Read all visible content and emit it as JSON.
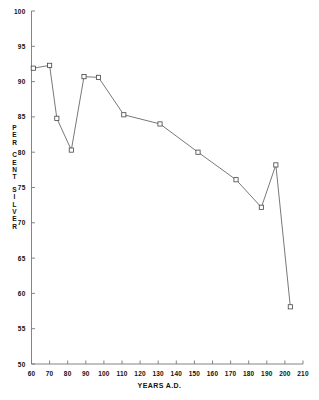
{
  "chart_data": {
    "type": "line",
    "title": "",
    "xlabel": "YEARS A.D.",
    "ylabel": "PER CENT SILVER",
    "ylabel_letters": [
      "P",
      "E",
      "R",
      "",
      "C",
      "E",
      "N",
      "T",
      "",
      "S",
      "I",
      "L",
      "V",
      "E",
      "R"
    ],
    "xlim": [
      60,
      210
    ],
    "ylim": [
      50,
      100
    ],
    "xticks": [
      60,
      70,
      80,
      90,
      100,
      110,
      120,
      130,
      140,
      150,
      160,
      170,
      180,
      190,
      200,
      210
    ],
    "yticks": [
      50,
      55,
      60,
      65,
      70,
      75,
      80,
      85,
      90,
      95,
      100
    ],
    "grid": false,
    "legend": false,
    "marker": "open-square",
    "line_color": "#555555",
    "marker_color": "#444444",
    "axis_color": "#777777",
    "x": [
      61,
      70,
      74,
      82,
      89,
      97,
      111,
      131,
      152,
      173,
      187,
      195,
      203
    ],
    "y": [
      91.9,
      92.3,
      84.8,
      80.3,
      90.7,
      90.6,
      85.3,
      84.0,
      80.0,
      76.1,
      72.2,
      78.2,
      58.1
    ],
    "points": [
      {
        "x": 61,
        "y": 91.9
      },
      {
        "x": 70,
        "y": 92.3
      },
      {
        "x": 74,
        "y": 84.8
      },
      {
        "x": 82,
        "y": 80.3
      },
      {
        "x": 89,
        "y": 90.7
      },
      {
        "x": 97,
        "y": 90.6
      },
      {
        "x": 111,
        "y": 85.3
      },
      {
        "x": 131,
        "y": 84.0
      },
      {
        "x": 152,
        "y": 80.0
      },
      {
        "x": 173,
        "y": 76.1
      },
      {
        "x": 187,
        "y": 72.2
      },
      {
        "x": 195,
        "y": 78.2
      },
      {
        "x": 203,
        "y": 58.1
      }
    ]
  }
}
